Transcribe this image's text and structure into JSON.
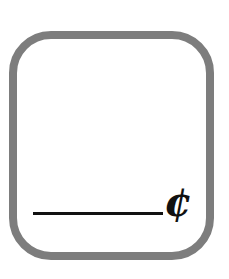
{
  "page": {
    "background_color": "#ffffff",
    "width": 229,
    "height": 279
  },
  "answer_box": {
    "border_color": "#7d7d7d",
    "border_width_px": 8,
    "corner_radius_px": 42,
    "fill_color": "#ffffff",
    "content": ""
  },
  "answer_line": {
    "color": "#111111",
    "thickness_px": 3,
    "value": "",
    "placeholder": ""
  },
  "unit": {
    "symbol": "¢",
    "name": "cent-sign",
    "color": "#111111"
  }
}
